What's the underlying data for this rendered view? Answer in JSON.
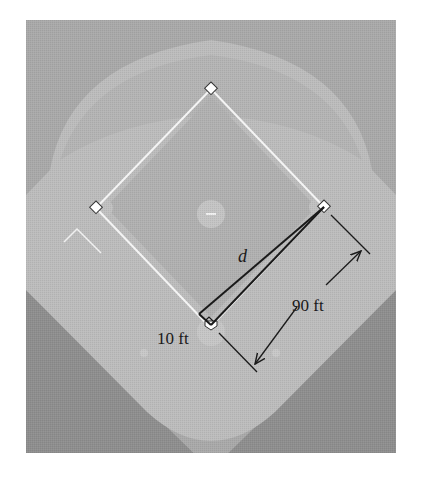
{
  "diagram": {
    "labels": {
      "hypotenuse": "d",
      "side_length": "90 ft",
      "offset": "10 ft"
    },
    "bases": [
      "home-plate",
      "first-base",
      "second-base",
      "third-base"
    ],
    "colors": {
      "background": "#ffffff",
      "foul_territory": "#8f8f8f",
      "outfield": "#a8a8a8",
      "infield_dirt": "#bdbdbd",
      "infield_grass": "#b2b2b2",
      "baselines": "#f4f4f4",
      "ink": "#1a1a1a"
    }
  }
}
